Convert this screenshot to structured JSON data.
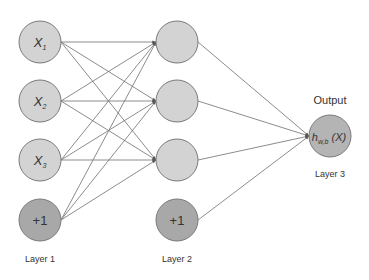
{
  "diagram": {
    "colors": {
      "hidden_fill": "#d3d3d3",
      "bias_fill": "#a8a8a8",
      "output_fill": "#b4b4b4",
      "stroke": "#7a7a7a",
      "edge": "#6e6e6e",
      "text": "#333333"
    },
    "layers": [
      {
        "label": "Layer 1",
        "nodes": [
          {
            "id": "x1",
            "label": "X",
            "sub": "1",
            "type": "input"
          },
          {
            "id": "x2",
            "label": "X",
            "sub": "2",
            "type": "input"
          },
          {
            "id": "x3",
            "label": "X",
            "sub": "3",
            "type": "input"
          },
          {
            "id": "b1",
            "label": "+1",
            "sub": "",
            "type": "bias"
          }
        ]
      },
      {
        "label": "Layer 2",
        "nodes": [
          {
            "id": "a1",
            "label": "",
            "sub": "",
            "type": "hidden"
          },
          {
            "id": "a2",
            "label": "",
            "sub": "",
            "type": "hidden"
          },
          {
            "id": "a3",
            "label": "",
            "sub": "",
            "type": "hidden"
          },
          {
            "id": "b2",
            "label": "+1",
            "sub": "",
            "type": "bias"
          }
        ]
      },
      {
        "label": "Layer 3",
        "heading": "Output",
        "nodes": [
          {
            "id": "out",
            "label": "h",
            "sub": "w,b",
            "suffix": " (X)",
            "type": "output"
          }
        ]
      }
    ],
    "edges": [
      [
        "x1",
        "a1"
      ],
      [
        "x1",
        "a2"
      ],
      [
        "x1",
        "a3"
      ],
      [
        "x2",
        "a1"
      ],
      [
        "x2",
        "a2"
      ],
      [
        "x2",
        "a3"
      ],
      [
        "x3",
        "a1"
      ],
      [
        "x3",
        "a2"
      ],
      [
        "x3",
        "a3"
      ],
      [
        "b1",
        "a1"
      ],
      [
        "b1",
        "a2"
      ],
      [
        "b1",
        "a3"
      ],
      [
        "a1",
        "out"
      ],
      [
        "a2",
        "out"
      ],
      [
        "a3",
        "out"
      ],
      [
        "b2",
        "out"
      ]
    ]
  }
}
